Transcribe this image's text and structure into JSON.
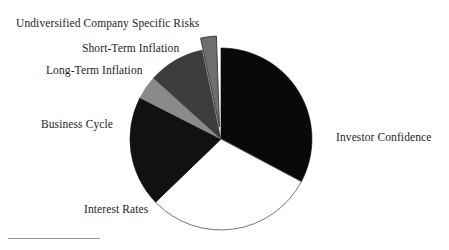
{
  "chart_data": {
    "type": "pie",
    "title": "",
    "subtitle": "",
    "xlabel": "",
    "ylabel": "",
    "legend_position": "none",
    "grid": false,
    "labels_placement": "outside-callout",
    "start_angle_deg": 0,
    "direction": "clockwise",
    "categories": [
      "Investor Confidence",
      "Interest Rates",
      "Business Cycle",
      "Long-Term Inflation",
      "Short-Term Inflation",
      "Undiversified Company Specific Risks"
    ],
    "values": [
      33,
      30,
      20,
      4,
      10,
      3
    ],
    "units": "percent",
    "slices": [
      {
        "label": "Investor Confidence",
        "value": 33,
        "start_deg": 0,
        "end_deg": 118,
        "color": "#090909",
        "exploded": false
      },
      {
        "label": "Interest Rates",
        "value": 30,
        "start_deg": 118,
        "end_deg": 226,
        "color": "#ffffff",
        "exploded": false
      },
      {
        "label": "Business Cycle",
        "value": 20,
        "start_deg": 226,
        "end_deg": 297,
        "color": "#111111",
        "exploded": false
      },
      {
        "label": "Long-Term Inflation",
        "value": 4,
        "start_deg": 297,
        "end_deg": 312,
        "color": "#8a8a8a",
        "exploded": false
      },
      {
        "label": "Short-Term Inflation",
        "value": 10,
        "start_deg": 312,
        "end_deg": 348,
        "color": "#3c3c3c",
        "exploded": false
      },
      {
        "label": "Undiversified Company Specific Risks",
        "value": 3,
        "start_deg": 348,
        "end_deg": 358,
        "color": "#6e6e6e",
        "exploded": true
      }
    ]
  },
  "labels": {
    "undiversified": "Undiversified Company Specific Risks",
    "short_term_inflation": "Short-Term Inflation",
    "long_term_inflation": "Long-Term Inflation",
    "business_cycle": "Business Cycle",
    "interest_rates": "Interest Rates",
    "investor_confidence": "Investor Confidence"
  },
  "colors": {
    "background": "#ffffff",
    "outline": "#555555",
    "text": "#1d1d1d",
    "rule": "#9a9a9a",
    "slice_black": "#090909",
    "slice_white": "#ffffff",
    "slice_dark_gray": "#3c3c3c",
    "slice_mid_gray": "#6e6e6e",
    "slice_light_gray": "#8a8a8a"
  }
}
